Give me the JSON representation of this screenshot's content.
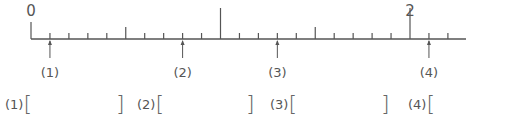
{
  "number_line": {
    "start_value": 0,
    "end_value": 2.2,
    "minor_step": 0.1,
    "labels": [
      {
        "value": 0,
        "text": "0"
      },
      {
        "value": 1,
        "text": "1"
      },
      {
        "value": 2,
        "text": "2"
      }
    ],
    "origin_x": 31,
    "unit_px": 189.5,
    "axis_y": 39,
    "axis_end_x": 466,
    "color": "#555555"
  },
  "arrows": [
    {
      "id": "1",
      "label": "(1)",
      "value": 0.1
    },
    {
      "id": "2",
      "label": "(2)",
      "value": 0.8
    },
    {
      "id": "3",
      "label": "(3)",
      "value": 1.3
    },
    {
      "id": "4",
      "label": "(4)",
      "value": 2.1
    }
  ],
  "answers": [
    {
      "label": "(1)",
      "open": "[",
      "close": "]",
      "value": ""
    },
    {
      "label": "(2)",
      "open": "[",
      "close": "]",
      "value": ""
    },
    {
      "label": "(3)",
      "open": "[",
      "close": "]",
      "value": ""
    },
    {
      "label": "(4)",
      "open": "[",
      "close": "",
      "value": ""
    }
  ]
}
